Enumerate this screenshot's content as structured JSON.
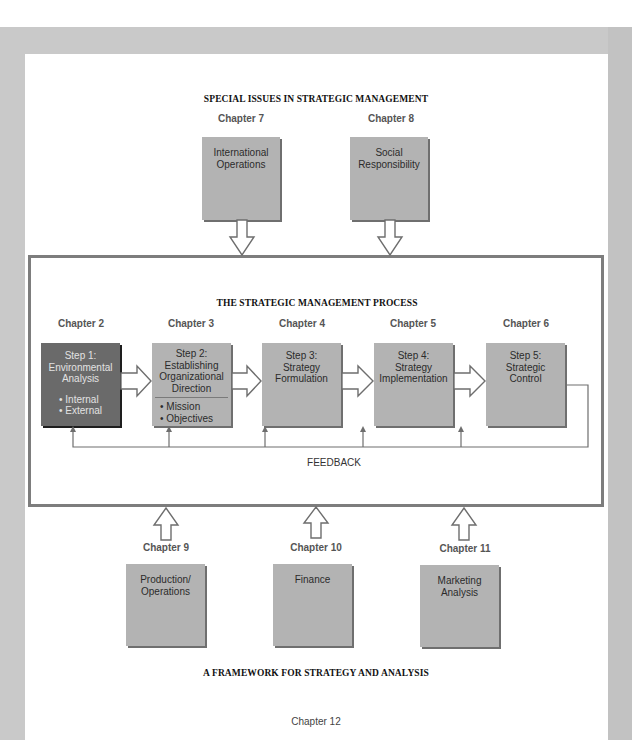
{
  "special_issues": {
    "title": "SPECIAL ISSUES IN STRATEGIC MANAGEMENT",
    "items": [
      {
        "chapter": "Chapter 7",
        "lines": [
          "International",
          "Operations"
        ]
      },
      {
        "chapter": "Chapter 8",
        "lines": [
          "Social",
          "Responsibility"
        ]
      }
    ]
  },
  "process": {
    "title": "THE STRATEGIC MANAGEMENT PROCESS",
    "steps": [
      {
        "chapter": "Chapter 2",
        "lines": [
          "Step 1:",
          "Environmental",
          "Analysis"
        ],
        "bullets": [
          "Internal",
          "External"
        ],
        "highlight": true
      },
      {
        "chapter": "Chapter 3",
        "lines": [
          "Step 2:",
          "Establishing",
          "Organizational",
          "Direction"
        ],
        "bullets": [
          "Mission",
          "Objectives"
        ],
        "highlight": false
      },
      {
        "chapter": "Chapter 4",
        "lines": [
          "Step 3:",
          "Strategy",
          "Formulation"
        ],
        "bullets": [],
        "highlight": false
      },
      {
        "chapter": "Chapter 5",
        "lines": [
          "Step 4:",
          "Strategy",
          "Implementation"
        ],
        "bullets": [],
        "highlight": false
      },
      {
        "chapter": "Chapter 6",
        "lines": [
          "Step 5:",
          "Strategic",
          "Control"
        ],
        "bullets": [],
        "highlight": false
      }
    ],
    "feedback_label": "FEEDBACK"
  },
  "functional": {
    "items": [
      {
        "chapter": "Chapter 9",
        "lines": [
          "Production/",
          "Operations"
        ]
      },
      {
        "chapter": "Chapter 10",
        "lines": [
          "Finance"
        ]
      },
      {
        "chapter": "Chapter 11",
        "lines": [
          "Marketing",
          "Analysis"
        ]
      }
    ]
  },
  "framework": {
    "title": "A FRAMEWORK FOR STRATEGY AND ANALYSIS",
    "chapter": "Chapter 12"
  },
  "colors": {
    "frame": "#c9c9c9",
    "box": "#b3b3b3",
    "box_dark": "#6a6a6a",
    "border": "#7d7d7d"
  }
}
